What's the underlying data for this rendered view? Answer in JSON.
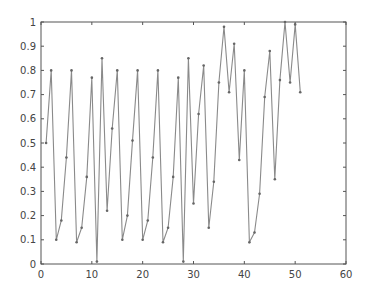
{
  "chart_data": {
    "type": "line",
    "title": "",
    "xlabel": "",
    "ylabel": "",
    "xlim": [
      0,
      60
    ],
    "ylim": [
      0,
      1
    ],
    "xticks": [
      0,
      10,
      20,
      30,
      40,
      50,
      60
    ],
    "yticks": [
      0,
      0.1,
      0.2,
      0.3,
      0.4,
      0.5,
      0.6,
      0.7,
      0.8,
      0.9,
      1
    ],
    "xtick_labels": [
      "0",
      "10",
      "20",
      "30",
      "40",
      "50",
      "60"
    ],
    "ytick_labels": [
      "0",
      "0.1",
      "0.2",
      "0.3",
      "0.4",
      "0.5",
      "0.6",
      "0.7",
      "0.8",
      "0.9",
      "1"
    ],
    "grid": false,
    "legend": null,
    "series": [
      {
        "name": "series-1",
        "color": "#888888",
        "marker": "dot",
        "x": [
          1,
          2,
          3,
          4,
          5,
          6,
          7,
          8,
          9,
          10,
          11,
          12,
          13,
          14,
          15,
          16,
          17,
          18,
          19,
          20,
          21,
          22,
          23,
          24,
          25,
          26,
          27,
          28,
          29,
          30,
          31,
          32,
          33,
          34,
          35,
          36,
          37,
          38,
          39,
          40,
          41,
          42,
          43,
          44,
          45,
          46,
          47,
          48,
          49,
          50,
          51
        ],
        "values": [
          0.5,
          0.8,
          0.1,
          0.18,
          0.44,
          0.8,
          0.09,
          0.15,
          0.36,
          0.77,
          0.01,
          0.85,
          0.22,
          0.56,
          0.8,
          0.1,
          0.2,
          0.51,
          0.8,
          0.1,
          0.18,
          0.44,
          0.8,
          0.09,
          0.15,
          0.36,
          0.77,
          0.01,
          0.85,
          0.25,
          0.62,
          0.82,
          0.15,
          0.34,
          0.75,
          0.98,
          0.71,
          0.91,
          0.43,
          0.8,
          0.09,
          0.13,
          0.29,
          0.69,
          0.88,
          0.35,
          0.76,
          1.0,
          0.75,
          0.99,
          0.71
        ]
      }
    ]
  },
  "style": {
    "axis_color": "#555555",
    "line_color": "#8a8a8a",
    "marker_color": "#666666"
  }
}
